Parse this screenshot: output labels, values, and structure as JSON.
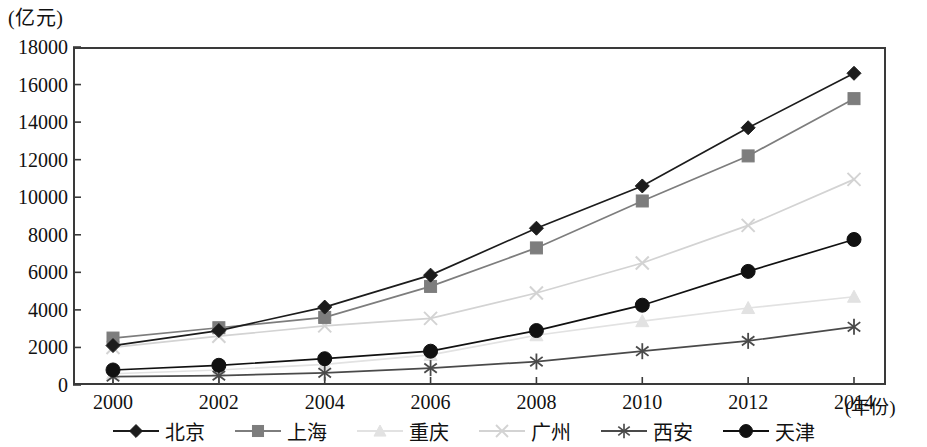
{
  "axis": {
    "unit_label": "(亿元)",
    "x_axis_title": "(年份)",
    "y_ticks": [
      "18000",
      "16000",
      "14000",
      "12000",
      "10000",
      "8000",
      "6000",
      "4000",
      "2000",
      "0"
    ],
    "x_ticks": [
      "2000",
      "2002",
      "2004",
      "2006",
      "2008",
      "2010",
      "2012",
      "2014"
    ]
  },
  "legend": {
    "items": [
      {
        "label": "北京",
        "color": "#1c1c1c",
        "marker": "diamond"
      },
      {
        "label": "上海",
        "color": "#7d7d7d",
        "marker": "square"
      },
      {
        "label": "重庆",
        "color": "#e2e2e2",
        "marker": "triangle"
      },
      {
        "label": "广州",
        "color": "#d3d3d3",
        "marker": "cross"
      },
      {
        "label": "西安",
        "color": "#4a4a4a",
        "marker": "asterisk"
      },
      {
        "label": "天津",
        "color": "#111111",
        "marker": "circle"
      }
    ]
  },
  "chart_data": {
    "type": "line",
    "title": "",
    "xlabel": "(年份)",
    "ylabel": "(亿元)",
    "x": [
      2000,
      2002,
      2004,
      2006,
      2008,
      2010,
      2012,
      2014
    ],
    "xlim": [
      1999,
      2015
    ],
    "ylim": [
      0,
      18000
    ],
    "ytick_step": 2000,
    "grid": false,
    "legend_position": "bottom",
    "series": [
      {
        "name": "北京",
        "color": "#1c1c1c",
        "marker": "diamond",
        "values": [
          2100,
          2900,
          4150,
          5850,
          8350,
          10600,
          13700,
          16600
        ]
      },
      {
        "name": "上海",
        "color": "#7d7d7d",
        "marker": "square",
        "values": [
          2500,
          3050,
          3600,
          5250,
          7300,
          9800,
          12200,
          15250
        ]
      },
      {
        "name": "重庆",
        "color": "#e2e2e2",
        "marker": "triangle",
        "values": [
          600,
          800,
          1100,
          1600,
          2650,
          3400,
          4100,
          4700
        ]
      },
      {
        "name": "广州",
        "color": "#d3d3d3",
        "marker": "cross",
        "values": [
          2000,
          2600,
          3150,
          3550,
          4900,
          6500,
          8500,
          10950
        ]
      },
      {
        "name": "西安",
        "color": "#4a4a4a",
        "marker": "asterisk",
        "values": [
          450,
          500,
          650,
          900,
          1250,
          1800,
          2350,
          3100
        ]
      },
      {
        "name": "天津",
        "color": "#111111",
        "marker": "circle",
        "values": [
          800,
          1050,
          1400,
          1800,
          2900,
          4250,
          6050,
          7750
        ]
      }
    ]
  }
}
